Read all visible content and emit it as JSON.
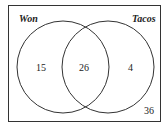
{
  "diagram": {
    "type": "venn",
    "sets": [
      {
        "name": "Won",
        "only_count": "15"
      },
      {
        "name": "Tacos",
        "only_count": "4"
      }
    ],
    "intersection_count": "26",
    "outside_count": "36"
  }
}
